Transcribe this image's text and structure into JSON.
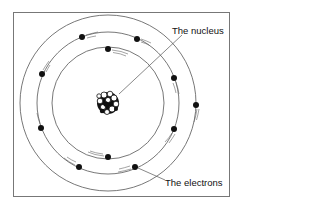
{
  "diagram": {
    "labels": {
      "nucleus": "The nucleus",
      "electrons": "The electrons"
    },
    "colors": {
      "line": "#555555",
      "electron": "#111111",
      "frame": "#777777"
    },
    "nucleus": {
      "cx": 108,
      "cy": 103
    },
    "orbits": [
      {
        "name": "inner",
        "r": 56
      },
      {
        "name": "middle",
        "r": 71
      },
      {
        "name": "outer",
        "r": 88
      }
    ],
    "electrons": [
      {
        "x": 108,
        "y": 49
      },
      {
        "x": 108,
        "y": 157
      },
      {
        "x": 82,
        "y": 37
      },
      {
        "x": 137,
        "y": 39
      },
      {
        "x": 42,
        "y": 74
      },
      {
        "x": 174,
        "y": 78
      },
      {
        "x": 41,
        "y": 128
      },
      {
        "x": 174,
        "y": 129
      },
      {
        "x": 79,
        "y": 167
      },
      {
        "x": 135,
        "y": 167
      },
      {
        "x": 196,
        "y": 105
      }
    ]
  }
}
